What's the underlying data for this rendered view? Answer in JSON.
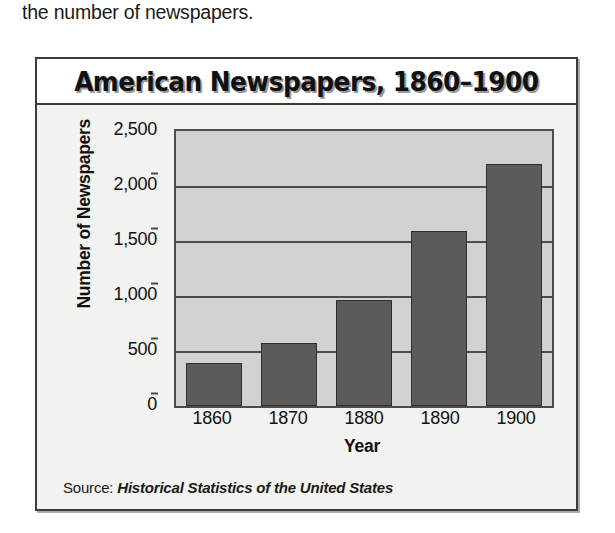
{
  "page": {
    "intro_text": "the number of newspapers."
  },
  "figure": {
    "source_prefix": "Source:",
    "source_title": "Historical Statistics of the United States"
  },
  "chart_data": {
    "type": "bar",
    "title": "American Newspapers, 1860–1900",
    "xlabel": "Year",
    "ylabel": "Number of Newspapers",
    "categories": [
      "1860",
      "1870",
      "1880",
      "1890",
      "1900"
    ],
    "values": [
      390,
      575,
      965,
      1590,
      2200
    ],
    "ylim": [
      0,
      2500
    ],
    "yticks": [
      0,
      500,
      1000,
      1500,
      2000,
      2500
    ],
    "ytick_labels": [
      "0",
      "500",
      "1,000",
      "1,500",
      "2,000",
      "2,500"
    ],
    "grid": true,
    "legend": null,
    "bar_color": "#5b5b5b",
    "plot_background": "#d2d2d0",
    "source": "Source: Historical Statistics of the United States"
  }
}
